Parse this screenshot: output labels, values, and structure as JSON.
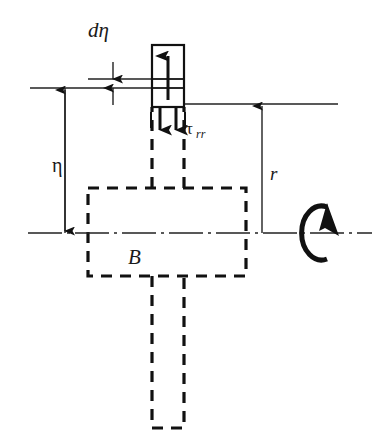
{
  "figure": {
    "type": "technical-diagram",
    "background_color": "#ffffff",
    "line_color": "#111111"
  },
  "labels": {
    "d_eta": "dη",
    "eta": "η",
    "r": "r",
    "B": "B",
    "tau_base": "τ",
    "tau_subscript": "rr"
  },
  "elements": {
    "element_box": "stress-element-box",
    "up_arrow": "upward-stress-arrow",
    "down_arrows": "downward-stress-arrows",
    "rotation_symbol": "rotation-arrow-symbol",
    "body_region": "dashed-body-region-B",
    "axis": "rotation-centerline",
    "reference_line_upper": "upper-reference-line",
    "reference_line_lower": "lower-reference-line",
    "reference_line_right": "right-reference-line"
  },
  "dimensions": {
    "d_eta_description": "differential thickness d-eta measured between two reference lines",
    "eta_description": "distance eta from centerline to reference line",
    "r_description": "radius r from centerline to the right reference line"
  },
  "geometry": {
    "centerline_y": 233,
    "element_box": {
      "x": 152,
      "y": 45,
      "width": 32,
      "height": 62
    },
    "body_rect": {
      "x": 88,
      "y": 188,
      "width": 158,
      "height": 88
    },
    "stem_rect": {
      "x": 152,
      "y": 276,
      "width": 32,
      "height": 152
    },
    "upper_stem": {
      "x": 152,
      "y": 107,
      "width": 32,
      "height": 81
    },
    "eta_arrow_x": 65,
    "r_arrow_x": 262
  }
}
